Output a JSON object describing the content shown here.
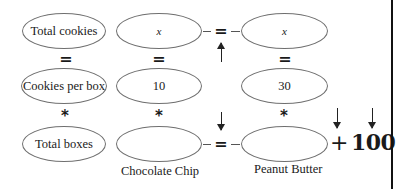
{
  "diagram": {
    "row1": {
      "label": "Total cookies",
      "chocolate_chip": "x",
      "peanut_butter": "x",
      "connector": "="
    },
    "row2": {
      "label": "Cookies per box",
      "chocolate_chip": "10",
      "peanut_butter": "30"
    },
    "row3": {
      "label": "Total boxes",
      "chocolate_chip": "",
      "peanut_butter": "",
      "connector": "=",
      "plus": "+",
      "addend": "100"
    },
    "column_labels": {
      "chocolate_chip": "Chocolate Chip",
      "peanut_butter": "Peanut Butter"
    },
    "operators": {
      "equals": "=",
      "multiply": "*"
    },
    "colors": {
      "ellipse_border": "#6f6f6f",
      "text": "#1a1a1a",
      "divider": "#111111"
    }
  }
}
